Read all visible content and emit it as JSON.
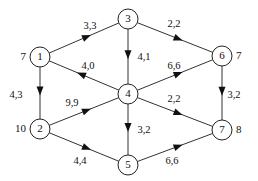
{
  "diagram": {
    "type": "directed network flow graph",
    "nodes": [
      {
        "id": "1",
        "x": 40,
        "y": 57,
        "label": "1",
        "value": "7",
        "value_side": "left"
      },
      {
        "id": "2",
        "x": 40,
        "y": 129,
        "label": "2",
        "value": "10",
        "value_side": "left"
      },
      {
        "id": "3",
        "x": 128,
        "y": 19,
        "label": "3",
        "value": "",
        "value_side": "none"
      },
      {
        "id": "4",
        "x": 128,
        "y": 94,
        "label": "4",
        "value": "",
        "value_side": "none"
      },
      {
        "id": "5",
        "x": 128,
        "y": 165,
        "label": "5",
        "value": "",
        "value_side": "none"
      },
      {
        "id": "6",
        "x": 222,
        "y": 56,
        "label": "6",
        "value": "7",
        "value_side": "right"
      },
      {
        "id": "7",
        "x": 222,
        "y": 130,
        "label": "7",
        "value": "8",
        "value_side": "right"
      }
    ],
    "edges": [
      {
        "from": "1",
        "to": "3",
        "label": "3,3",
        "lx": 90,
        "ly": 27,
        "t": 0.6
      },
      {
        "from": "3",
        "to": "6",
        "label": "2,2",
        "lx": 174,
        "ly": 25,
        "t": 0.6
      },
      {
        "from": "3",
        "to": "4",
        "label": "4,1",
        "lx": 144,
        "ly": 58,
        "t": 0.55
      },
      {
        "from": "4",
        "to": "1",
        "label": "4,0",
        "lx": 88,
        "ly": 67,
        "t": 0.6
      },
      {
        "from": "4",
        "to": "6",
        "label": "6,6",
        "lx": 174,
        "ly": 67,
        "t": 0.6
      },
      {
        "from": "1",
        "to": "2",
        "label": "4,3",
        "lx": 16,
        "ly": 96,
        "t": 0.55
      },
      {
        "from": "2",
        "to": "4",
        "label": "9,9",
        "lx": 72,
        "ly": 104,
        "t": 0.6
      },
      {
        "from": "4",
        "to": "7",
        "label": "2,2",
        "lx": 174,
        "ly": 100,
        "t": 0.6
      },
      {
        "from": "4",
        "to": "5",
        "label": "3,2",
        "lx": 144,
        "ly": 131,
        "t": 0.55
      },
      {
        "from": "6",
        "to": "7",
        "label": "3,2",
        "lx": 234,
        "ly": 96,
        "t": 0.55
      },
      {
        "from": "2",
        "to": "5",
        "label": "4,4",
        "lx": 80,
        "ly": 162,
        "t": 0.6
      },
      {
        "from": "5",
        "to": "7",
        "label": "6,6",
        "lx": 172,
        "ly": 162,
        "t": 0.6
      }
    ]
  },
  "style": {
    "node_radius": 10,
    "stroke": "#222222",
    "background": "#ffffff"
  }
}
